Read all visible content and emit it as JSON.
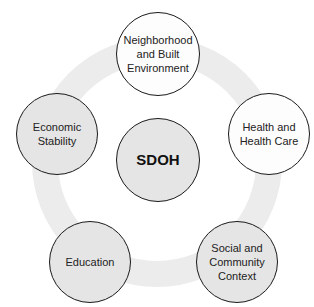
{
  "diagram": {
    "title": "SDOH",
    "center": {
      "label": "SDOH"
    },
    "nodes": [
      {
        "id": "neighborhood",
        "label": "Neighborhood and Built Environment",
        "lines": [
          "Neighborhood",
          "and Built",
          "Environment"
        ],
        "fill": "white"
      },
      {
        "id": "health",
        "label": "Health and Health Care",
        "lines": [
          "Health and",
          "Health Care"
        ],
        "fill": "white"
      },
      {
        "id": "social",
        "label": "Social and Community Context",
        "lines": [
          "Social and",
          "Community",
          "Context"
        ],
        "fill": "grey"
      },
      {
        "id": "education",
        "label": "Education",
        "lines": [
          "Education"
        ],
        "fill": "grey"
      },
      {
        "id": "economic",
        "label": "Economic Stability",
        "lines": [
          "Economic",
          "Stability"
        ],
        "fill": "grey"
      }
    ]
  },
  "colors": {
    "ring": "#ececec",
    "node_grey": "#e5e5e5",
    "node_white": "#fdfdfd",
    "stroke": "#1a1a1a",
    "text": "#222222"
  }
}
